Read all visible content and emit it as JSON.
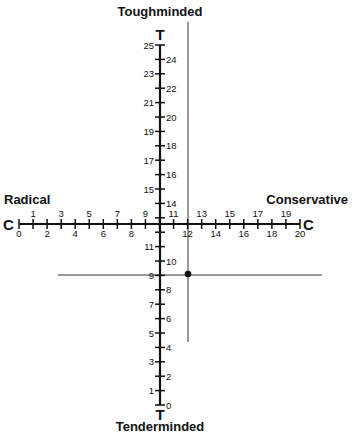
{
  "title_top": "Toughminded",
  "title_bottom": "Tenderminded",
  "label_left": "Radical",
  "label_right": "Conservative",
  "vertical_axis": {
    "letter_top": "T",
    "letter_bottom": "T",
    "min": 0,
    "max": 25,
    "labels_left": [
      "1",
      "3",
      "5",
      "7",
      "9",
      "11",
      "15",
      "17",
      "19",
      "21",
      "23",
      "25"
    ],
    "labels_right": [
      "0",
      "2",
      "4",
      "6",
      "8",
      "10",
      "14",
      "16",
      "18",
      "20",
      "22",
      "24"
    ]
  },
  "horizontal_axis": {
    "letter_left": "C",
    "letter_right": "C",
    "min": 0,
    "max": 20,
    "labels_top": [
      "1",
      "3",
      "5",
      "7",
      "9",
      "11",
      "13",
      "15",
      "17",
      "19"
    ],
    "labels_bottom": [
      "0",
      "2",
      "4",
      "6",
      "8",
      "12",
      "14",
      "16",
      "18",
      "20"
    ]
  },
  "marked_point": {
    "C": 12,
    "T": 9
  },
  "colors": {
    "ink": "#111111",
    "reference_line": "#333333"
  }
}
